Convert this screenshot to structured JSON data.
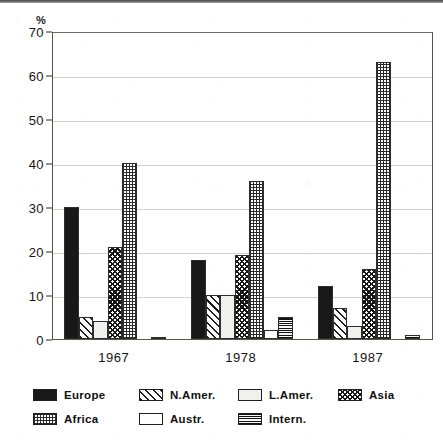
{
  "chart_data": {
    "type": "bar",
    "title": "",
    "subtitle": "",
    "xlabel": "",
    "ylabel": "%",
    "ylim": [
      0,
      70
    ],
    "yticks": [
      0,
      10,
      20,
      30,
      40,
      50,
      60,
      70
    ],
    "ytick_labels": [
      "0",
      "10",
      "20",
      "30",
      "40",
      "50",
      "60",
      "70"
    ],
    "grid": true,
    "legend_position": "bottom",
    "categories": [
      "1967",
      "1978",
      "1987"
    ],
    "series": [
      {
        "name": "Europe",
        "pattern": "solid-black",
        "values": [
          30,
          18,
          12
        ]
      },
      {
        "name": "N.Amer.",
        "pattern": "diagonal-hatch",
        "values": [
          5,
          10,
          7
        ]
      },
      {
        "name": "L.Amer.",
        "pattern": "light-dotted",
        "values": [
          4,
          10,
          3
        ]
      },
      {
        "name": "Asia",
        "pattern": "dark-crosshatch",
        "values": [
          21,
          19,
          16
        ]
      },
      {
        "name": "Africa",
        "pattern": "fine-dotted-grid",
        "values": [
          40,
          36,
          63
        ]
      },
      {
        "name": "Austr.",
        "pattern": "empty-white",
        "values": [
          0,
          2,
          0
        ]
      },
      {
        "name": "Intern.",
        "pattern": "dark-checkered",
        "values": [
          0.5,
          5,
          1
        ]
      }
    ]
  },
  "axis": {
    "unit_label": "%"
  },
  "colors": {
    "ink": "#181818",
    "frame": "#55564f",
    "grid": "#cfd2cc",
    "paper": "#ffffff"
  }
}
